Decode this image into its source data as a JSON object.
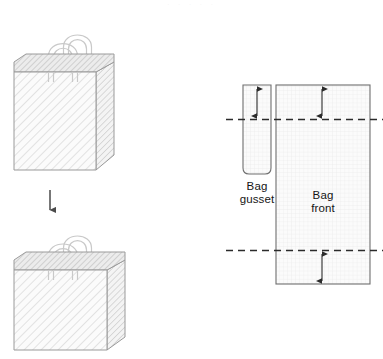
{
  "figure": {
    "kind": "technical-illustration",
    "background": "#ffffff",
    "top_artifact_text": "· · · · ·"
  },
  "left_panel": {
    "name": "bag-renderings",
    "items": [
      {
        "id": "tall-bag",
        "label": "",
        "description": "three-dimensional hatched shopping bag, tall proportion, two loop handles",
        "handles": 2
      },
      {
        "id": "short-bag",
        "label": "",
        "description": "three-dimensional hatched shopping bag, short proportion, two loop handles",
        "handles": 2
      }
    ],
    "transform_arrow": {
      "direction": "down",
      "label": ""
    },
    "colors": {
      "outline": "#9a9a9a",
      "hatch": "#d8d8d8",
      "face": "#fafafa",
      "side_panel": "#f0f0f0",
      "rim": "#e4e4e4",
      "handle": "#ffffff",
      "handle_outline": "#c9c9c9",
      "arrow": "#4a4a4a"
    }
  },
  "right_panel": {
    "name": "flat-pattern-diagram",
    "panels": [
      {
        "id": "gusset",
        "label_line1": "Bag",
        "label_line2": "gusset"
      },
      {
        "id": "front",
        "label_line1": "Bag",
        "label_line2": "front"
      }
    ],
    "fold_lines": [
      {
        "id": "top-fold",
        "style": "dashed"
      },
      {
        "id": "bottom-fold",
        "style": "dashed"
      }
    ],
    "dimensions": [
      {
        "id": "gusset-top-dim",
        "arrowheads": "both",
        "label": ""
      },
      {
        "id": "front-top-dim",
        "arrowheads": "both",
        "label": ""
      },
      {
        "id": "front-bottom-dim",
        "arrowheads": "both",
        "label": ""
      }
    ],
    "colors": {
      "outline": "#6f6f6f",
      "grid": "#ededed",
      "fill": "#fbfbfb",
      "dash": "#2b2b2b",
      "arrow": "#2b2b2b",
      "text": "#151515"
    }
  }
}
